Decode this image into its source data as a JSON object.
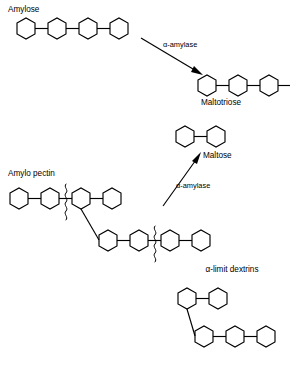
{
  "diagram": {
    "title_visible": false,
    "background_color": "#ffffff",
    "stroke_color": "#000000",
    "labels": {
      "amylose": "Amylose",
      "maltotriose": "Maltotriose",
      "maltose": "Maltose",
      "amylopectin": "Amylo pectin",
      "alpha_limit_dextrins": "α-limit dextrins",
      "enzyme_top": "α-amylase",
      "enzyme_bottom": "α-amylase"
    },
    "structures": [
      {
        "id": "amylose",
        "name": "Amylose",
        "label": "Amylose",
        "label_position": {
          "x": 8,
          "y": 12
        },
        "description": "linear chain of glucose units",
        "unit_count": 4,
        "branched": false,
        "cleavage_marks": 0
      },
      {
        "id": "maltotriose",
        "name": "Maltotriose",
        "label": "Maltotriose",
        "label_position": {
          "x": 201,
          "y": 105
        },
        "description": "linear chain of three glucose units with terminal bond stub",
        "unit_count": 3,
        "branched": false,
        "cleavage_marks": 0
      },
      {
        "id": "maltose",
        "name": "Maltose",
        "label": "Maltose",
        "label_position": {
          "x": 203,
          "y": 158
        },
        "description": "disaccharide of two glucose units",
        "unit_count": 2,
        "branched": false,
        "cleavage_marks": 0
      },
      {
        "id": "amylopectin",
        "name": "Amylo pectin",
        "label": "Amylo pectin",
        "label_position": {
          "x": 8,
          "y": 176
        },
        "description": "branched glucose polymer: upper linear chain with a branch descending to a lower chain; wavy lines mark alpha-amylase cleavage sites",
        "unit_count_main_chain": 4,
        "unit_count_branch_chain": 4,
        "branched": true,
        "cleavage_marks": 2
      },
      {
        "id": "alpha-limit-dextrins",
        "name": "α-limit dextrins",
        "label": "α-limit dextrins",
        "label_position": {
          "x": 232,
          "y": 272
        },
        "description": "branched residual oligosaccharide: two glucose units on upper arm joined by a branch to a lower chain of three units",
        "unit_count_upper": 2,
        "unit_count_lower": 3,
        "branched": true,
        "cleavage_marks": 0
      }
    ],
    "reactions": [
      {
        "id": "amylose-to-maltotriose",
        "enzyme": "α-amylase",
        "enzyme_label_position": {
          "x": 163,
          "y": 47
        },
        "substrate": "Amylose",
        "product": "Maltotriose",
        "arrow_direction": "down-right",
        "arrow_from": {
          "x": 143,
          "y": 39
        },
        "arrow_to": {
          "x": 203,
          "y": 75
        }
      },
      {
        "id": "amylopectin-to-maltose",
        "enzyme": "α-amylase",
        "enzyme_label_position": {
          "x": 176,
          "y": 188
        },
        "substrate": "Amylo pectin",
        "product": "Maltose",
        "arrow_direction": "up-right",
        "arrow_from": {
          "x": 163,
          "y": 206
        },
        "arrow_to": {
          "x": 196,
          "y": 158
        }
      }
    ]
  }
}
